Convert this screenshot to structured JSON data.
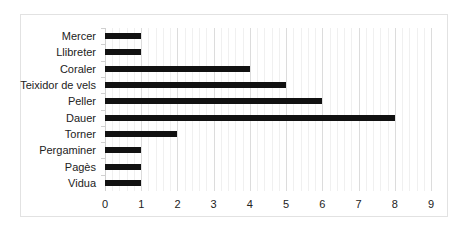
{
  "chart_data": {
    "type": "bar",
    "orientation": "horizontal",
    "title": "",
    "xlabel": "",
    "ylabel": "",
    "categories": [
      "Mercer",
      "Llibreter",
      "Coraler",
      "Teixidor de vels",
      "Peller",
      "Dauer",
      "Torner",
      "Pergaminer",
      "Pagès",
      "Vidua"
    ],
    "values": [
      1,
      1,
      4,
      5,
      6,
      8,
      2,
      1,
      1,
      1
    ],
    "xlim": [
      0,
      9
    ],
    "xticks": [
      "0",
      "1",
      "2",
      "3",
      "4",
      "5",
      "6",
      "7",
      "8",
      "9"
    ],
    "grid": true,
    "legend": null,
    "bar_color": "#111111"
  }
}
